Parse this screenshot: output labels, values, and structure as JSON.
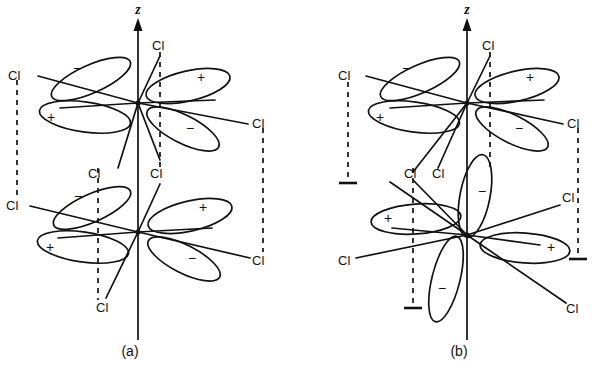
{
  "figure": {
    "type": "chemistry-orbital-diagram",
    "background_color": "#ffffff",
    "line_color": "#111111"
  },
  "panels": [
    {
      "id": "a",
      "caption": "(a)",
      "axis_label": "z",
      "centers": [
        {
          "id": "a-top",
          "lobes": [
            {
              "position": "upper-left",
              "sign": "−"
            },
            {
              "position": "upper-right",
              "sign": "+"
            },
            {
              "position": "lower-left",
              "sign": "+"
            },
            {
              "position": "lower-right",
              "sign": "−"
            }
          ],
          "ligands": [
            "Cl",
            "Cl",
            "Cl",
            "Cl"
          ]
        },
        {
          "id": "a-bottom",
          "lobes": [
            {
              "position": "upper-left",
              "sign": "−"
            },
            {
              "position": "upper-right",
              "sign": "+"
            },
            {
              "position": "lower-left",
              "sign": "+"
            },
            {
              "position": "lower-right",
              "sign": "−"
            }
          ],
          "ligands": [
            "Cl",
            "Cl",
            "Cl",
            "Cl"
          ]
        }
      ],
      "bridge_lines": {
        "style": "dashed",
        "arrowheads": false,
        "count": 3
      }
    },
    {
      "id": "b",
      "caption": "(b)",
      "axis_label": "z",
      "centers": [
        {
          "id": "b-top",
          "lobes": [
            {
              "position": "upper-left",
              "sign": "−"
            },
            {
              "position": "upper-right",
              "sign": "+"
            },
            {
              "position": "lower-left",
              "sign": "+"
            },
            {
              "position": "lower-right",
              "sign": "−"
            }
          ],
          "ligands": [
            "Cl",
            "Cl",
            "Cl",
            "Cl"
          ]
        },
        {
          "id": "b-bottom",
          "rotated": true,
          "lobes": [
            {
              "position": "up",
              "sign": "−"
            },
            {
              "position": "left",
              "sign": "+"
            },
            {
              "position": "right",
              "sign": "+"
            },
            {
              "position": "down",
              "sign": "−"
            }
          ],
          "ligands": [
            "Cl",
            "Cl",
            "Cl",
            "Cl"
          ]
        }
      ],
      "bridge_lines": {
        "style": "dashed",
        "arrowheads": true,
        "count": 3
      }
    }
  ],
  "labels": {
    "cl": "Cl",
    "z": "z",
    "plus": "+",
    "minus": "−",
    "panel_a": "(a)",
    "panel_b": "(b)"
  }
}
